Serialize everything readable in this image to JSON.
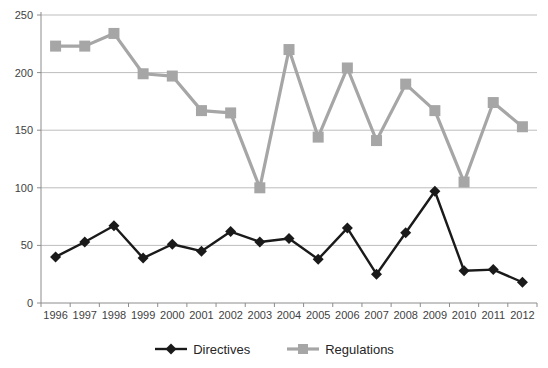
{
  "chart_data": {
    "type": "line",
    "x": [
      "1996",
      "1997",
      "1998",
      "1999",
      "2000",
      "2001",
      "2002",
      "2003",
      "2004",
      "2005",
      "2006",
      "2007",
      "2008",
      "2009",
      "2010",
      "2011",
      "2012"
    ],
    "series": [
      {
        "name": "Directives",
        "marker": "diamond",
        "color": "#1a1a1a",
        "values": [
          40,
          53,
          67,
          39,
          51,
          45,
          62,
          53,
          56,
          38,
          65,
          25,
          61,
          97,
          28,
          29,
          18
        ]
      },
      {
        "name": "Regulations",
        "marker": "square",
        "color": "#a6a6a6",
        "values": [
          223,
          223,
          234,
          199,
          197,
          167,
          165,
          100,
          220,
          144,
          204,
          141,
          190,
          167,
          105,
          174,
          153
        ]
      }
    ],
    "title": "",
    "xlabel": "",
    "ylabel": "",
    "ylim": [
      0,
      250
    ],
    "yticks": [
      0,
      50,
      100,
      150,
      200,
      250
    ],
    "grid": true,
    "legend_position": "bottom"
  },
  "colors": {
    "background": "#ffffff",
    "gridline": "#bdbdbd",
    "axis": "#8c8c8c",
    "tick_text": "#3f3f3f"
  }
}
